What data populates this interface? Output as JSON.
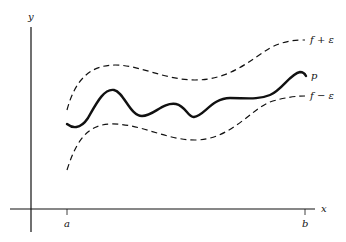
{
  "figure": {
    "axes": {
      "x_label": "x",
      "y_label": "y",
      "ticks": [
        {
          "label": "a"
        },
        {
          "label": "b"
        }
      ]
    },
    "curves": {
      "upper_label": "f + ε",
      "lower_label": "f − ε",
      "poly_label": "p"
    },
    "colors": {
      "ink": "#111111",
      "background": "#ffffff"
    }
  }
}
